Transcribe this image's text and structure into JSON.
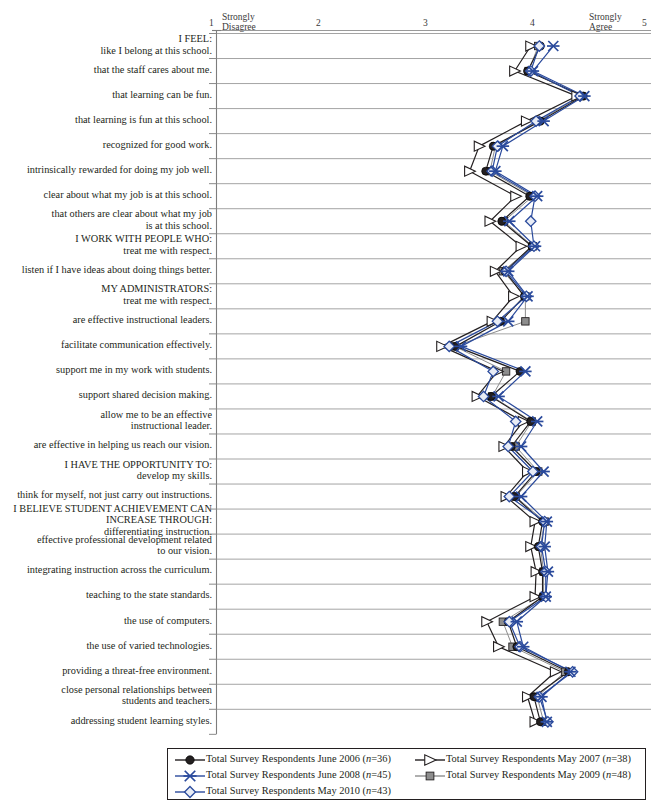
{
  "chart_data": {
    "type": "line",
    "orientation": "horizontal",
    "title": "",
    "xlabel": "",
    "ylabel": "",
    "xlim": [
      1,
      5
    ],
    "grid": "horizontal-row-separators",
    "legend_position": "bottom",
    "axis": {
      "ticks": [
        1,
        2,
        3,
        4,
        5
      ],
      "tick_labels": [
        "1",
        "2",
        "3",
        "4",
        "5"
      ],
      "low_anchor": "Strongly\nDisagree",
      "high_anchor": "Strongly\nAgree"
    },
    "categories": [
      "I FEEL:\nlike I belong at this school.",
      "that the staff cares about me.",
      "that learning can be fun.",
      "that learning is fun at this school.",
      "recognized for good work.",
      "intrinsically rewarded for doing my job well.",
      "clear about what my job is at this school.",
      "that others are clear about what my job\nis at this school.",
      "I WORK WITH PEOPLE WHO:\ntreat me with respect.",
      "listen if I have ideas about doing things better.",
      "MY ADMINISTRATORS:\ntreat me with respect.",
      "are effective instructional leaders.",
      "facilitate communication effectively.",
      "support me in my work with students.",
      "support shared decision making.",
      "allow me to be an effective\ninstructional leader.",
      "are effective in helping us reach our vision.",
      "I HAVE THE OPPORTUNITY TO:\ndevelop my skills.",
      "think for myself, not just carry out instructions.",
      "I BELIEVE STUDENT ACHIEVEMENT CAN\nINCREASE THROUGH:\ndifferentiating instruction.",
      "effective professional development related\nto our vision.",
      "integrating instruction across the curriculum.",
      "teaching to the state standards.",
      "the use of computers.",
      "the use of varied technologies.",
      "providing a threat-free environment.",
      "close personal relationships between\nstudents and teachers.",
      "addressing student learning styles."
    ],
    "series": [
      {
        "name": "Total Survey Respondents June 2006",
        "n": 36,
        "label": "Total Survey Respondents June 2006 (n=36)",
        "color": "#231f20",
        "marker": "circle-filled",
        "values": [
          4.02,
          3.9,
          4.42,
          4.02,
          3.58,
          3.51,
          3.92,
          3.66,
          3.94,
          3.69,
          3.87,
          3.65,
          3.23,
          3.83,
          3.56,
          3.93,
          3.75,
          3.98,
          3.78,
          4.04,
          4.0,
          4.04,
          4.04,
          3.72,
          3.8,
          4.28,
          3.96,
          4.02
        ]
      },
      {
        "name": "Total Survey Respondents May 2007",
        "n": 38,
        "label": "Total Survey Respondents May 2007 (n=38)",
        "color": "#231f20",
        "marker": "triangle-open",
        "values": [
          3.93,
          3.78,
          4.36,
          3.89,
          3.45,
          3.36,
          3.79,
          3.55,
          3.84,
          3.6,
          3.77,
          3.57,
          3.1,
          3.62,
          3.43,
          3.86,
          3.68,
          3.9,
          3.7,
          3.97,
          3.93,
          3.98,
          3.97,
          3.52,
          3.63,
          4.16,
          3.9,
          3.97
        ]
      },
      {
        "name": "Total Survey Respondents June 2008",
        "n": 45,
        "label": "Total Survey Respondents June 2008 (n=45)",
        "color": "#2a4a9c",
        "marker": "asterisk",
        "values": [
          4.14,
          3.95,
          4.43,
          4.05,
          3.67,
          3.6,
          3.99,
          3.73,
          3.97,
          3.72,
          3.9,
          3.72,
          3.28,
          3.88,
          3.63,
          3.99,
          3.84,
          4.05,
          3.84,
          4.08,
          4.06,
          4.09,
          4.07,
          3.8,
          3.86,
          4.3,
          4.03,
          4.08
        ]
      },
      {
        "name": "Total Survey Respondents May 2009",
        "n": 48,
        "label": "Total Survey Respondents May 2009 (n=48)",
        "color": "#8d8d8d",
        "marker": "square-filled",
        "values": [
          4.0,
          3.91,
          4.4,
          4.0,
          3.6,
          3.55,
          3.95,
          3.68,
          3.95,
          3.67,
          3.88,
          3.88,
          3.22,
          3.7,
          3.57,
          3.94,
          3.79,
          4.0,
          3.79,
          4.06,
          4.02,
          4.05,
          4.05,
          3.67,
          3.76,
          4.25,
          3.99,
          4.05
        ]
      },
      {
        "name": "Total Survey Respondents May 2010",
        "n": 43,
        "label": "Total Survey Respondents May 2010 (n=43)",
        "color": "#2a4a9c",
        "marker": "diamond-open",
        "values": [
          4.01,
          3.93,
          4.39,
          3.98,
          3.62,
          3.57,
          3.97,
          3.93,
          3.96,
          3.7,
          3.89,
          3.62,
          3.17,
          3.58,
          3.49,
          3.79,
          3.72,
          3.95,
          3.73,
          4.06,
          4.03,
          4.07,
          4.07,
          3.73,
          3.83,
          4.32,
          4.01,
          4.09
        ]
      }
    ]
  },
  "legend": {
    "entries": [
      {
        "label": "Total Survey Respondents June 2006 (n=36)",
        "marker": "circle-filled",
        "color": "#231f20"
      },
      {
        "label": "Total Survey Respondents May 2007 (n=38)",
        "marker": "triangle-open",
        "color": "#231f20"
      },
      {
        "label": "Total Survey Respondents June 2008 (n=45)",
        "marker": "asterisk",
        "color": "#2a4a9c"
      },
      {
        "label": "Total Survey Respondents May 2009 (n=48)",
        "marker": "square-filled",
        "color": "#8d8d8d"
      },
      {
        "label": "Total Survey Respondents May 2010 (n=43)",
        "marker": "diamond-open",
        "color": "#2a4a9c"
      }
    ]
  },
  "colors": {
    "dark": "#231f20",
    "blue": "#2a4a9c",
    "gray": "#8d8d8d",
    "rule": "#9a9a9a"
  }
}
